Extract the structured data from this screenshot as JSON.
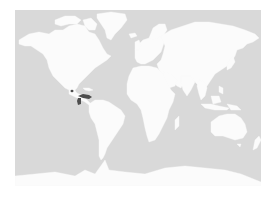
{
  "map": {
    "type": "world-locator-map",
    "projection": "mercator",
    "colors": {
      "ocean": "#d9d9d9",
      "land": "#fbfbfb",
      "highlight": "#4d4d4d",
      "background": "#ffffff"
    },
    "highlighted_regions": [
      {
        "name": "Central America (Honduras/Nicaragua area)",
        "approx_px": [
          72,
          91
        ]
      },
      {
        "name": "Northern South America (Colombia/Venezuela area)",
        "approx_px": [
          84,
          98
        ]
      }
    ]
  }
}
